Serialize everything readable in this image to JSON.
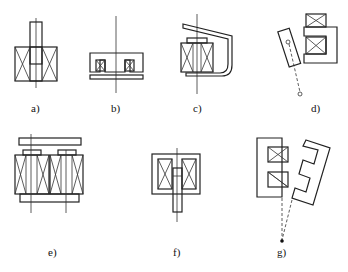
{
  "figure": {
    "panels": [
      {
        "id": "a",
        "label": "a)",
        "type": "plunger-solenoid"
      },
      {
        "id": "b",
        "label": "b)",
        "type": "flat-pot-core"
      },
      {
        "id": "c",
        "label": "c)",
        "type": "clapper-armature"
      },
      {
        "id": "d",
        "label": "d)",
        "type": "pivoting-armature"
      },
      {
        "id": "e",
        "label": "e)",
        "type": "double-coil-E-core"
      },
      {
        "id": "f",
        "label": "f)",
        "type": "enclosed-plunger"
      },
      {
        "id": "g",
        "label": "g)",
        "type": "rotating-E-armature"
      }
    ]
  },
  "colors": {
    "line": "#222222",
    "background": "#ffffff"
  }
}
